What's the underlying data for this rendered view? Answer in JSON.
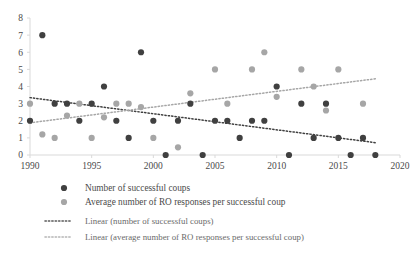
{
  "chart_data": {
    "type": "scatter",
    "title": "",
    "xlabel": "",
    "ylabel": "",
    "xlim": [
      1990,
      2020
    ],
    "ylim": [
      0,
      8
    ],
    "grid": false,
    "legend_position": "bottom",
    "xticks": [
      "1990",
      "1995",
      "2000",
      "2005",
      "2010",
      "2015",
      "2020"
    ],
    "xtick_values": [
      1990,
      1995,
      2000,
      2005,
      2010,
      2015,
      2020
    ],
    "yticks": [
      "0",
      "1",
      "2",
      "3",
      "4",
      "5",
      "6",
      "7",
      "8"
    ],
    "ytick_values": [
      0,
      1,
      2,
      3,
      4,
      5,
      6,
      7,
      8
    ],
    "series": [
      {
        "name": "Number of successful coups",
        "type": "scatter",
        "color": "#404040",
        "marker": "circle",
        "x": [
          1990,
          1991,
          1992,
          1993,
          1994,
          1995,
          1996,
          1997,
          1998,
          1999,
          2000,
          2001,
          2002,
          2003,
          2004,
          2005,
          2006,
          2007,
          2008,
          2009,
          2010,
          2011,
          2012,
          2013,
          2014,
          2015,
          2016,
          2017,
          2018
        ],
        "values": [
          2,
          7,
          3,
          3,
          2,
          3,
          4,
          2,
          1,
          6,
          2,
          0,
          2,
          3,
          0,
          2,
          2,
          1,
          2,
          2,
          4,
          0,
          3,
          1,
          3,
          1,
          0,
          1,
          0
        ]
      },
      {
        "name": "Average number of RO responses per successful coup",
        "type": "scatter",
        "color": "#a6a6a6",
        "marker": "circle",
        "x": [
          1990,
          1991,
          1992,
          1993,
          1994,
          1995,
          1996,
          1997,
          1998,
          1999,
          2000,
          2002,
          2003,
          2005,
          2006,
          2008,
          2009,
          2010,
          2012,
          2013,
          2014,
          2015,
          2017
        ],
        "values": [
          3,
          1.2,
          1,
          2.3,
          3,
          1,
          2.2,
          3,
          3,
          2.8,
          1,
          0.45,
          3.6,
          5,
          3,
          5,
          6,
          3.4,
          5,
          4,
          2.6,
          5,
          3
        ]
      },
      {
        "name": "Linear (number of successful coups)",
        "type": "line",
        "style": "dotted",
        "color": "#404040",
        "x": [
          1990,
          2018
        ],
        "values": [
          3.35,
          0.72
        ]
      },
      {
        "name": "Linear (average number of RO responses per successful coup)",
        "type": "line",
        "style": "dotted",
        "color": "#a6a6a6",
        "x": [
          1990,
          2018
        ],
        "values": [
          1.88,
          4.45
        ]
      }
    ],
    "legend": [
      {
        "label": "Number of successful coups",
        "marker": "circle",
        "color": "#404040"
      },
      {
        "label": "Average number of RO responses per successful coup",
        "marker": "circle",
        "color": "#a6a6a6"
      },
      {
        "label": "Linear (number of successful coups)",
        "marker": "dotted-line",
        "color": "#595959"
      },
      {
        "label": "Linear (average number of RO responses per successful coup)",
        "marker": "dotted-line",
        "color": "#b5b5b5"
      }
    ]
  }
}
